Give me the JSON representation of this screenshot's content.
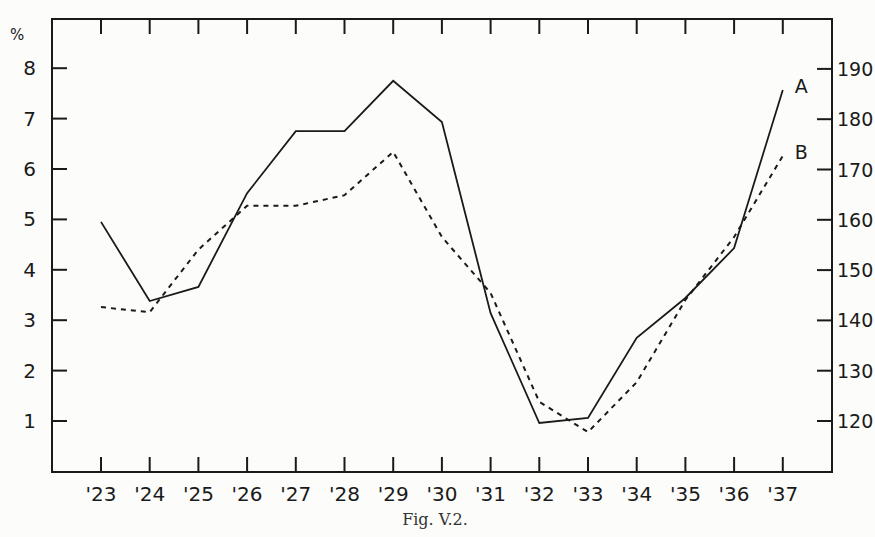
{
  "chart_data": {
    "type": "line",
    "title": "",
    "caption": "Fig. V.2.",
    "xlabel": "",
    "ylabel_left": "%",
    "ylabel_right": "",
    "categories": [
      "'23",
      "'24",
      "'25",
      "'26",
      "'27",
      "'28",
      "'29",
      "'30",
      "'31",
      "'32",
      "'33",
      "'34",
      "'35",
      "'36",
      "'37"
    ],
    "y_left": {
      "ticks": [
        1,
        2,
        3,
        4,
        5,
        6,
        7,
        8
      ],
      "unit": "%",
      "range": [
        0,
        9
      ]
    },
    "y_right": {
      "ticks": [
        120,
        130,
        140,
        150,
        160,
        170,
        180,
        190
      ]
    },
    "grid": false,
    "legend": "inline end labels",
    "series": [
      {
        "name": "A",
        "style": "solid",
        "axis": "left",
        "values": [
          4.95,
          3.38,
          3.66,
          5.52,
          6.75,
          6.75,
          7.75,
          6.93,
          3.14,
          0.96,
          1.06,
          2.65,
          3.44,
          4.43,
          7.57
        ]
      },
      {
        "name": "B",
        "style": "dashed",
        "axis": "left",
        "values": [
          3.26,
          3.16,
          4.4,
          5.27,
          5.27,
          5.48,
          6.34,
          4.65,
          3.54,
          1.38,
          0.78,
          1.77,
          3.4,
          4.65,
          6.26
        ]
      }
    ]
  },
  "layout": {
    "frame": {
      "left": 52,
      "top": 19,
      "right": 832,
      "bottom": 472
    },
    "x_first": 101,
    "x_step": 48.7,
    "y_left_1": 421,
    "y_left_per_unit": 50.4,
    "y_right_120": 421,
    "y_right_per_unit": 5.03
  }
}
